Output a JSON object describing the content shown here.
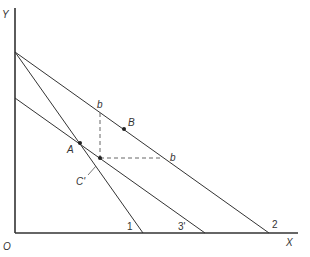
{
  "diagram": {
    "axes": {
      "x_label": "X",
      "y_label": "Y",
      "origin_label": "O"
    },
    "lines": [
      {
        "id": "line-2",
        "label": "2"
      },
      {
        "id": "line-1",
        "label": "1"
      },
      {
        "id": "line-3",
        "label": "3'"
      }
    ],
    "points": {
      "A": "A",
      "B": "B",
      "C": "C'"
    },
    "dashed_labels": {
      "b_top": "b",
      "b_right": "b"
    },
    "colors": {
      "ink": "#333333",
      "background": "#ffffff"
    }
  }
}
